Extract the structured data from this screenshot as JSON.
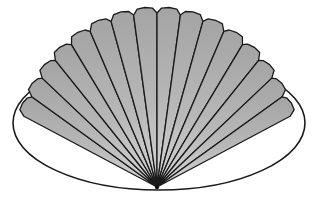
{
  "image": {
    "subject": "folding fan",
    "description": "Pleated hand fan over an ellipse outline"
  },
  "colors": {
    "background": "#ffffff",
    "panel_fill_light": "#c4c4c4",
    "panel_fill_dark": "#9a9a9a",
    "outline": "#1a1a1a"
  },
  "fan": {
    "pivot": [
      157,
      187
    ],
    "panel_count": 16,
    "start_angle_deg": 208,
    "end_angle_deg": 332
  },
  "ellipse": {
    "cx": 159,
    "cy": 123,
    "rx": 146,
    "ry": 67
  }
}
